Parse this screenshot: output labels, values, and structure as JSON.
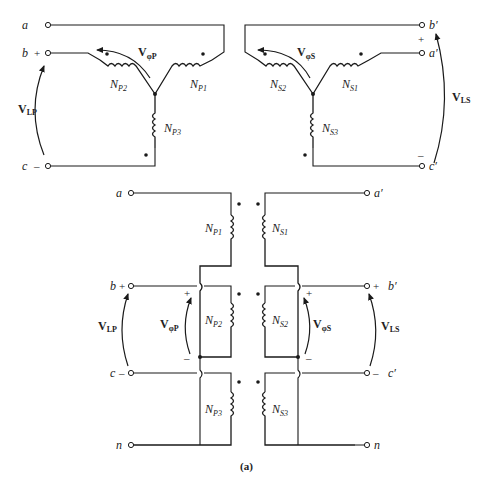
{
  "figure": {
    "caption": "(a)",
    "top_left_wye": {
      "terminals": [
        "a",
        "b",
        "c"
      ],
      "signs": {
        "b": "+",
        "c": "–"
      },
      "windings": [
        "N",
        "N",
        "N"
      ],
      "winding_subs": [
        "P1",
        "P2",
        "P3"
      ],
      "phase_voltage": {
        "main": "V",
        "sub": "φP"
      },
      "line_voltage": {
        "main": "V",
        "sub": "LP"
      }
    },
    "top_right_wye": {
      "terminals": [
        "b′",
        "a′",
        "c′"
      ],
      "signs": {
        "top": "+",
        "bottom": "–"
      },
      "windings": [
        "N",
        "N",
        "N"
      ],
      "winding_subs": [
        "S1",
        "S2",
        "S3"
      ],
      "phase_voltage": {
        "main": "V",
        "sub": "φS"
      },
      "line_voltage": {
        "main": "V",
        "sub": "LS"
      }
    },
    "bottom": {
      "left_terminals": [
        "a",
        "b",
        "c",
        "n"
      ],
      "right_terminals": [
        "a′",
        "b′",
        "c′",
        "n"
      ],
      "left_signs": {
        "b": "+",
        "c": "–"
      },
      "right_signs": {
        "b": "+",
        "c": "–"
      },
      "primary_subs": [
        "P1",
        "P2",
        "P3"
      ],
      "secondary_subs": [
        "S1",
        "S2",
        "S3"
      ],
      "N": "N",
      "vphiP": {
        "main": "V",
        "sub": "φP",
        "plus": "+",
        "minus": "–"
      },
      "vphiS": {
        "main": "V",
        "sub": "φS",
        "plus": "+",
        "minus": "–"
      },
      "vLP": {
        "main": "V",
        "sub": "LP"
      },
      "vLS": {
        "main": "V",
        "sub": "LS"
      }
    }
  }
}
